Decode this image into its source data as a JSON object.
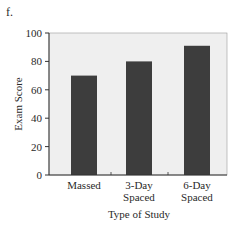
{
  "panel_label": "f.",
  "colors": {
    "plot_background": "#efefef",
    "bar": "#3d3d3d",
    "axis": "#333333"
  },
  "chart_data": {
    "type": "bar",
    "title": "",
    "categories": [
      "Massed",
      "3-Day Spaced",
      "6-Day Spaced"
    ],
    "category_lines": [
      [
        "Massed"
      ],
      [
        "3-Day",
        "Spaced"
      ],
      [
        "6-Day",
        "Spaced"
      ]
    ],
    "values": [
      70,
      80,
      91
    ],
    "xlabel": "Type of Study",
    "ylabel": "Exam Score",
    "ylim": [
      0,
      100
    ],
    "yticks": [
      0,
      20,
      40,
      60,
      80,
      100
    ],
    "grid": false,
    "legend": null
  }
}
